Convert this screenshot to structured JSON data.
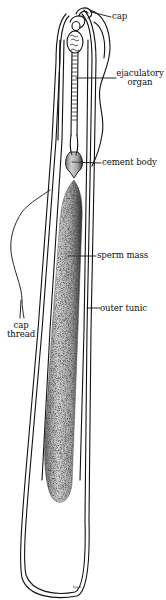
{
  "figure": {
    "labels": {
      "cap": "cap",
      "ejaculatory_organ_line1": "ejaculatory",
      "ejaculatory_organ_line2": "organ",
      "cement_body": "cement body",
      "sperm_mass": "sperm mass",
      "outer_tunic": "outer tunic",
      "cap_thread_line1": "cap",
      "cap_thread_line2": "thread"
    },
    "signature": "hjgw",
    "colors": {
      "line": "#111111",
      "background": "#ffffff",
      "stipple": "#555555"
    }
  }
}
